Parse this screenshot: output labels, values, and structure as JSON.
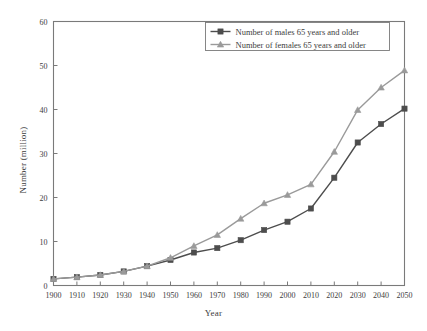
{
  "chart_data": {
    "type": "line",
    "title": "",
    "xlabel": "Year",
    "ylabel": "Number (million)",
    "x": [
      1900,
      1910,
      1920,
      1930,
      1940,
      1950,
      1960,
      1970,
      1980,
      1990,
      2000,
      2010,
      2020,
      2030,
      2040,
      2050
    ],
    "categories": [
      "1900",
      "1910",
      "1920",
      "1930",
      "1940",
      "1950",
      "1960",
      "1970",
      "1980",
      "1990",
      "2000",
      "2010",
      "2020",
      "2030",
      "2040",
      "2050"
    ],
    "series": [
      {
        "name": "Number of males 65 years and older",
        "color": "#4d4d4d",
        "marker": "square",
        "values": [
          1.5,
          1.9,
          2.4,
          3.2,
          4.4,
          5.8,
          7.5,
          8.5,
          10.3,
          12.6,
          14.5,
          17.5,
          24.5,
          32.5,
          36.7,
          40.2
        ]
      },
      {
        "name": "Number of females 65 years and older",
        "color": "#9a9a9a",
        "marker": "triangle",
        "values": [
          1.5,
          1.9,
          2.4,
          3.2,
          4.4,
          6.3,
          9.0,
          11.5,
          15.2,
          18.7,
          20.6,
          23.0,
          30.4,
          39.9,
          45.0,
          48.9
        ]
      }
    ],
    "xlim": [
      1900,
      2050
    ],
    "ylim": [
      0,
      60
    ],
    "yticks": [
      0,
      10,
      20,
      30,
      40,
      50,
      60
    ],
    "ytick_labels": [
      "0",
      "10",
      "20",
      "30",
      "40",
      "50",
      "60"
    ],
    "xticks": [
      1900,
      1910,
      1920,
      1930,
      1940,
      1950,
      1960,
      1970,
      1980,
      1990,
      2000,
      2010,
      2020,
      2030,
      2040,
      2050
    ],
    "grid": false,
    "legend_position": "top-right-inside"
  },
  "legend": {
    "entries": [
      {
        "label": "Number of males 65 years and older"
      },
      {
        "label": "Number of females 65 years and older"
      }
    ]
  },
  "colors": {
    "males": "#4d4d4d",
    "females": "#9a9a9a",
    "axis": "#7a7a7a",
    "text": "#3d3d3d",
    "background": "#ffffff"
  }
}
